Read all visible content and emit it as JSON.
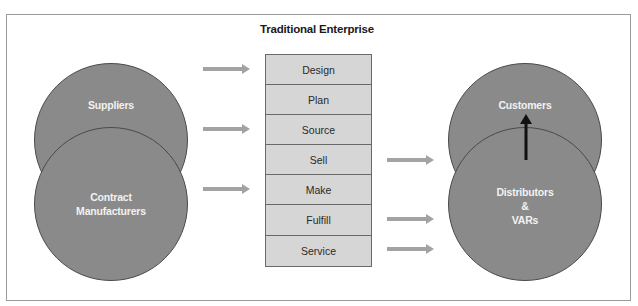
{
  "title": "Traditional Enterprise",
  "left_circles": {
    "suppliers": "Suppliers",
    "contract_line1": "Contract",
    "contract_line2": "Manufacturers"
  },
  "right_circles": {
    "customers": "Customers",
    "distributors_line1": "Distributors",
    "distributors_line2": "&",
    "distributors_line3": "VARs"
  },
  "functions": [
    "Design",
    "Plan",
    "Source",
    "Sell",
    "Make",
    "Fulfill",
    "Service"
  ],
  "inbound_arrows_to": [
    "Design",
    "Source",
    "Make"
  ],
  "outbound_arrows_from": [
    "Sell",
    "Fulfill",
    "Service"
  ],
  "colors": {
    "circle_fill": "#8a8a8a",
    "box_fill": "#d6d6d6",
    "arrow_gray": "#a3a3a3",
    "arrow_dark": "#111111"
  }
}
